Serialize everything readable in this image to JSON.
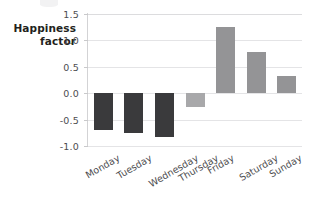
{
  "chart_data": {
    "type": "bar",
    "title": "",
    "subtitle": "",
    "xlabel": "",
    "ylabel": "Happiness factor",
    "ylabel_lines": [
      "Happiness",
      "factor"
    ],
    "categories": [
      "Monday",
      "Tuesday",
      "Wednesday",
      "Thursday",
      "Friday",
      "Saturday",
      "Sunday"
    ],
    "values": [
      -0.69,
      -0.75,
      -0.83,
      -0.27,
      1.25,
      0.78,
      0.33
    ],
    "series": [
      {
        "name": "Happiness factor",
        "values": [
          -0.69,
          -0.75,
          -0.83,
          -0.27,
          1.25,
          0.78,
          0.33
        ]
      }
    ],
    "ylim": [
      -1.0,
      1.5
    ],
    "yticks": [
      1.5,
      1.0,
      0.5,
      0.0,
      -0.5,
      -1.0
    ],
    "ytick_labels": [
      "1.5",
      "1.0",
      "0.5",
      "0.0",
      "-0.5",
      "-1.0"
    ],
    "grid": true,
    "grid_axis": "y",
    "legend": false,
    "legend_position": "none",
    "xtick_rotation": -30,
    "bar_colors": [
      "#3a3a3c",
      "#3a3a3c",
      "#3a3a3c",
      "#a8a8aa",
      "#949496",
      "#949496",
      "#949496"
    ],
    "colors": {
      "negative_dark": "#3a3a3c",
      "negative_light": "#a8a8aa",
      "positive": "#949496",
      "gridline": "#e4e4e6",
      "axis_line": "#d3d3d5",
      "tick_text": "#4d4d4f",
      "label_text": "#231f20",
      "background": "#ffffff"
    }
  }
}
